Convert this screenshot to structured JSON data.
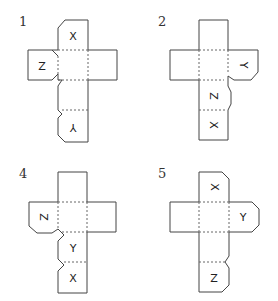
{
  "nets": [
    {
      "number": "1",
      "labels": {
        "top": "X",
        "left": "Z",
        "bottom": "Y"
      }
    },
    {
      "number": "2",
      "labels": {
        "right": "Y",
        "third": "Z",
        "bottom": "X"
      }
    },
    {
      "number": "4",
      "labels": {
        "left": "Z",
        "third": "Y",
        "bottom": "X"
      }
    },
    {
      "number": "5",
      "labels": {
        "top": "X",
        "right": "Y",
        "bottom": "Z"
      }
    }
  ]
}
